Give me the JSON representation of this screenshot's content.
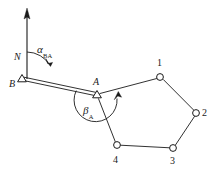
{
  "figure": {
    "type": "surveying-traverse-diagram",
    "background_color": "#ffffff",
    "line_color": "#1a1a1a",
    "width": 222,
    "height": 179
  },
  "north_arrow": {
    "name": "north-arrow",
    "label": "N",
    "tail": [
      27,
      79
    ],
    "tip": [
      27,
      10
    ]
  },
  "angles": [
    {
      "name": "azimuth-bearing-angle",
      "label": "α",
      "subscript": "BA",
      "at_point": "B",
      "label_pos": [
        37,
        48
      ]
    },
    {
      "name": "traverse-angle-at-a",
      "label": "β",
      "subscript": "A",
      "at_point": "A",
      "label_pos": [
        84,
        108
      ]
    }
  ],
  "control_points": [
    {
      "name": "point-b",
      "label": "B",
      "marker": "triangle",
      "x": 22,
      "y": 79,
      "label_pos": [
        10,
        78
      ]
    },
    {
      "name": "point-a",
      "label": "A",
      "marker": "triangle",
      "x": 97,
      "y": 95,
      "label_pos": [
        94,
        78
      ]
    }
  ],
  "traverse_points": [
    {
      "name": "station-1",
      "label": "1",
      "marker": "circle",
      "x": 160,
      "y": 77,
      "label_pos": [
        157,
        60
      ]
    },
    {
      "name": "station-2",
      "label": "2",
      "marker": "circle",
      "x": 196,
      "y": 113,
      "label_pos": [
        203,
        108
      ]
    },
    {
      "name": "station-3",
      "label": "3",
      "marker": "circle",
      "x": 173,
      "y": 148,
      "label_pos": [
        170,
        156
      ]
    },
    {
      "name": "station-4",
      "label": "4",
      "marker": "circle",
      "x": 117,
      "y": 145,
      "label_pos": [
        113,
        156
      ]
    }
  ],
  "edges": [
    {
      "name": "edge-b-a",
      "from": "B",
      "to": "A",
      "style": "double"
    },
    {
      "name": "edge-a-1",
      "from": "A",
      "to": "1",
      "style": "single"
    },
    {
      "name": "edge-1-2",
      "from": "1",
      "to": "2",
      "style": "single"
    },
    {
      "name": "edge-2-3",
      "from": "2",
      "to": "3",
      "style": "single"
    },
    {
      "name": "edge-3-4",
      "from": "3",
      "to": "4",
      "style": "single"
    },
    {
      "name": "edge-4-a",
      "from": "4",
      "to": "A",
      "style": "single"
    }
  ]
}
